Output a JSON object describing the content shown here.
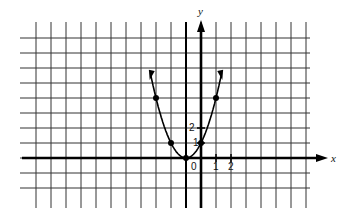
{
  "chart_data": {
    "type": "line",
    "title": "",
    "xlabel": "x",
    "ylabel": "y",
    "function": "y = (x + 1)^2",
    "grid": true,
    "x_tick_labels": [
      "0",
      "1",
      "2"
    ],
    "y_tick_labels": [
      "1",
      "2"
    ],
    "points": [
      {
        "x": -3,
        "y": 4
      },
      {
        "x": -2,
        "y": 1
      },
      {
        "x": -1,
        "y": 0
      },
      {
        "x": 0,
        "y": 1
      },
      {
        "x": 1,
        "y": 4
      }
    ],
    "xlim": [
      -11,
      8
    ],
    "ylim": [
      -2,
      8
    ],
    "colors": {
      "line": "#111111",
      "grid": "#333333",
      "background": "#ffffff"
    }
  },
  "labels": {
    "x_axis": "x",
    "y_axis": "y",
    "origin": "0",
    "x1": "1",
    "x2": "2",
    "y1": "1",
    "y2": "2"
  }
}
